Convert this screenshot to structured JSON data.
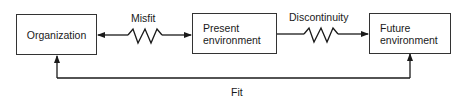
{
  "diagram": {
    "nodes": [
      {
        "id": "organization",
        "label": "Organization"
      },
      {
        "id": "present_environment",
        "label": "Present\nenvironment",
        "lines": [
          "Present",
          "environment"
        ]
      },
      {
        "id": "future_environment",
        "label": "Future\nenvironment",
        "lines": [
          "Future",
          "environment"
        ]
      }
    ],
    "edges": [
      {
        "from": "organization",
        "to": "present_environment",
        "label": "Misfit",
        "style": "double-arrow-zigzag"
      },
      {
        "from": "present_environment",
        "to": "future_environment",
        "label": "Discontinuity",
        "style": "arrow-zigzag"
      },
      {
        "from": "organization",
        "to": "future_environment",
        "label": "Fit",
        "style": "double-arrow-elbow-below"
      }
    ]
  },
  "colors": {
    "stroke": "#1a1a1a",
    "background": "#ffffff"
  }
}
